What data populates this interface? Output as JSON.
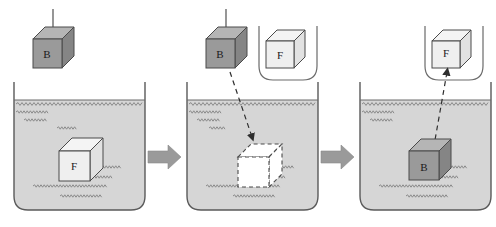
{
  "figure": {
    "title": "",
    "background_color": "#ffffff",
    "stroke_color": "#3a3a3a",
    "block_b_fill": "#9a9a9a",
    "block_b_top_fill": "#b5b5b5",
    "block_b_side_fill": "#858585",
    "block_f_fill": "#dcdcdc",
    "block_f_top_fill": "#eaeaea",
    "block_f_side_fill": "#cfcfcf",
    "dashed_cube_fill": "#ffffff",
    "fluid_fill": "#d6d6d6",
    "arrow_fill": "#9a9a9a",
    "beaker_fill": "#ffffff"
  },
  "panels": [
    {
      "id": "panel-1",
      "name": "initial-state",
      "blocks": [
        {
          "id": "block-b-1",
          "label": "B",
          "state": "suspended-above-fluid",
          "fill": "solid-gray",
          "has_string": true
        },
        {
          "id": "block-f-1",
          "label": "F",
          "state": "submerged-fluid-parcel",
          "fill": "outline-light"
        }
      ],
      "beaker": {
        "label": "",
        "fluid_level": "high"
      },
      "holder": null,
      "motion_arrow": null
    },
    {
      "id": "panel-2",
      "name": "block-lowered-state",
      "blocks": [
        {
          "id": "block-b-2",
          "label": "B",
          "state": "suspended-above-fluid",
          "fill": "solid-gray",
          "has_string": true
        },
        {
          "id": "block-f-2",
          "label": "F",
          "state": "in-holder",
          "fill": "outline-light"
        },
        {
          "id": "dashed-cube-2",
          "label": "",
          "state": "vacated-cavity",
          "fill": "dashed-white"
        }
      ],
      "beaker": {
        "label": "",
        "fluid_level": "high"
      },
      "holder": {
        "id": "holder-2",
        "shape": "u-shaped-cradle"
      },
      "motion_arrow": {
        "direction": "down-right",
        "style": "dashed",
        "from": "block-b-2",
        "to": "dashed-cube-2"
      }
    },
    {
      "id": "panel-3",
      "name": "final-state",
      "blocks": [
        {
          "id": "block-f-3",
          "label": "F",
          "state": "in-holder",
          "fill": "outline-light"
        },
        {
          "id": "block-b-3",
          "label": "B",
          "state": "submerged",
          "fill": "solid-gray"
        }
      ],
      "beaker": {
        "label": "",
        "fluid_level": "high"
      },
      "holder": {
        "id": "holder-3",
        "shape": "u-shaped-cradle"
      },
      "motion_arrow": {
        "direction": "up-right",
        "style": "dashed",
        "from": "block-b-3",
        "to": "block-f-3"
      }
    }
  ],
  "transitions": [
    {
      "id": "transition-1",
      "name": "step-arrow-1",
      "symbol": "→",
      "direction": "right"
    },
    {
      "id": "transition-2",
      "name": "step-arrow-2",
      "symbol": "→",
      "direction": "right"
    }
  ],
  "labels": {
    "block_b": "B",
    "block_f": "F"
  }
}
